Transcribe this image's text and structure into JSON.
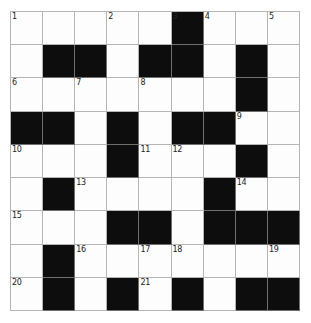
{
  "puzzle": {
    "type": "crossword-grid",
    "rows": 9,
    "columns": 9,
    "colors": {
      "block": "#0d0d0d",
      "open": "#fdfdfd",
      "grid_line": "#b5b5b5",
      "number_text": "#222222",
      "page_background": "#ffffff"
    },
    "legend": {
      "0": "open square",
      "1": "blocked (black) square"
    },
    "blocks": [
      [
        0,
        0,
        0,
        0,
        0,
        1,
        0,
        0,
        0
      ],
      [
        0,
        1,
        1,
        0,
        1,
        1,
        0,
        1,
        0
      ],
      [
        0,
        0,
        0,
        0,
        0,
        0,
        0,
        1,
        0
      ],
      [
        1,
        1,
        0,
        1,
        0,
        1,
        1,
        0,
        0
      ],
      [
        0,
        0,
        0,
        1,
        0,
        0,
        0,
        1,
        0
      ],
      [
        0,
        1,
        0,
        0,
        0,
        0,
        1,
        0,
        0
      ],
      [
        0,
        0,
        0,
        1,
        1,
        0,
        1,
        1,
        1
      ],
      [
        0,
        1,
        0,
        0,
        0,
        0,
        0,
        0,
        0
      ],
      [
        0,
        1,
        0,
        1,
        0,
        1,
        0,
        1,
        1
      ]
    ],
    "numbers": [
      [
        "1",
        "",
        "",
        "2",
        "",
        "3",
        "4",
        "",
        "5"
      ],
      [
        "",
        "",
        "",
        "",
        "",
        "",
        "",
        "",
        ""
      ],
      [
        "6",
        "",
        "7",
        "",
        "8",
        "",
        "",
        "",
        ""
      ],
      [
        "",
        "",
        "",
        "",
        "",
        "",
        "",
        "9",
        ""
      ],
      [
        "10",
        "",
        "",
        "",
        "11",
        "12",
        "",
        "",
        ""
      ],
      [
        "",
        "",
        "13",
        "",
        "",
        "",
        "",
        "14",
        ""
      ],
      [
        "15",
        "",
        "",
        "",
        "",
        "",
        "",
        "",
        ""
      ],
      [
        "",
        "",
        "16",
        "",
        "17",
        "18",
        "",
        "",
        "19"
      ],
      [
        "20",
        "",
        "",
        "",
        "21",
        "",
        "",
        "",
        ""
      ]
    ],
    "numbered_squares": [
      {
        "number": "1",
        "row": 1,
        "column": 1
      },
      {
        "number": "2",
        "row": 1,
        "column": 4
      },
      {
        "number": "3",
        "row": 1,
        "column": 6
      },
      {
        "number": "4",
        "row": 1,
        "column": 7
      },
      {
        "number": "5",
        "row": 1,
        "column": 9
      },
      {
        "number": "6",
        "row": 3,
        "column": 1
      },
      {
        "number": "7",
        "row": 3,
        "column": 3
      },
      {
        "number": "8",
        "row": 3,
        "column": 5
      },
      {
        "number": "9",
        "row": 4,
        "column": 8
      },
      {
        "number": "10",
        "row": 5,
        "column": 1
      },
      {
        "number": "11",
        "row": 5,
        "column": 5
      },
      {
        "number": "12",
        "row": 5,
        "column": 6
      },
      {
        "number": "13",
        "row": 6,
        "column": 3
      },
      {
        "number": "14",
        "row": 6,
        "column": 8
      },
      {
        "number": "15",
        "row": 7,
        "column": 1
      },
      {
        "number": "16",
        "row": 8,
        "column": 3
      },
      {
        "number": "17",
        "row": 8,
        "column": 5
      },
      {
        "number": "18",
        "row": 8,
        "column": 6
      },
      {
        "number": "19",
        "row": 8,
        "column": 9
      },
      {
        "number": "20",
        "row": 9,
        "column": 1
      },
      {
        "number": "21",
        "row": 9,
        "column": 5
      }
    ]
  }
}
